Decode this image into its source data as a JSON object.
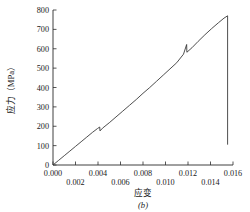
{
  "figure": {
    "caption": "(b)",
    "background_color": "#ffffff",
    "line_color": "#3a3a3a",
    "axis_color": "#2b2b2b"
  },
  "chart_data": {
    "type": "line",
    "title": "",
    "subtitle": "",
    "xlabel": "应变",
    "ylabel": "应力（MPa）",
    "xlim": [
      0.0,
      0.016
    ],
    "ylim": [
      0,
      800
    ],
    "grid": false,
    "legend": null,
    "legend_position": "none",
    "xticks": [
      0.0,
      0.002,
      0.004,
      0.006,
      0.008,
      0.01,
      0.012,
      0.014,
      0.016
    ],
    "xtick_labels": [
      "0.000",
      "0.002",
      "0.004",
      "0.006",
      "0.008",
      "0.010",
      "0.012",
      "0.014",
      "0.016"
    ],
    "yticks": [
      0,
      100,
      200,
      300,
      400,
      500,
      600,
      700,
      800
    ],
    "ytick_labels": [
      "0",
      "100",
      "200",
      "300",
      "400",
      "500",
      "600",
      "700",
      "800"
    ],
    "annotations": [
      {
        "text": "应力（MPa）",
        "role": "y-axis-title"
      },
      {
        "text": "应变",
        "role": "x-axis-title"
      },
      {
        "text": "(b)",
        "role": "figure-caption"
      }
    ],
    "series": [
      {
        "name": "stress-strain",
        "x": [
          0.0,
          0.0005,
          0.001,
          0.0015,
          0.002,
          0.0025,
          0.003,
          0.0035,
          0.00395,
          0.00415,
          0.00418,
          0.0044,
          0.005,
          0.0056,
          0.0062,
          0.0068,
          0.0074,
          0.008,
          0.0086,
          0.0092,
          0.0098,
          0.0104,
          0.011,
          0.0116,
          0.01188,
          0.0119,
          0.01235,
          0.0129,
          0.0135,
          0.0141,
          0.0147,
          0.0152,
          0.01552,
          0.01552
        ],
        "y": [
          0,
          24,
          48,
          72,
          96,
          120,
          144,
          168,
          188,
          196,
          176,
          190,
          218,
          248,
          278,
          308,
          338,
          370,
          400,
          432,
          464,
          496,
          528,
          572,
          622,
          582,
          605,
          638,
          672,
          704,
          734,
          758,
          770,
          105
        ]
      }
    ],
    "features": [
      {
        "type": "serration",
        "x": 0.00415,
        "y_before": 196,
        "y_after": 176,
        "note": "minor load drop"
      },
      {
        "type": "serration",
        "x": 0.01188,
        "y_before": 622,
        "y_after": 582,
        "note": "major load drop"
      },
      {
        "type": "peak",
        "x": 0.01552,
        "y": 770,
        "note": "ultimate stress"
      },
      {
        "type": "fracture",
        "x": 0.01552,
        "y_from": 770,
        "y_to": 105,
        "note": "vertical failure drop"
      }
    ]
  }
}
